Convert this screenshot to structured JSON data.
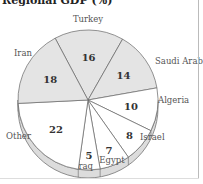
{
  "chart_data": {
    "type": "pie",
    "title": "Regional GDP (%)",
    "categories": [
      "Turkey",
      "Saudi Arabia",
      "Algeria",
      "Israel",
      "Egypt",
      "Iraq",
      "Other",
      "Iran"
    ],
    "values": [
      16,
      14,
      10,
      8,
      7,
      5,
      22,
      18
    ],
    "highlighted": [
      "Turkey",
      "Saudi Arabia",
      "Iran"
    ],
    "colors": {
      "highlight": "#e4e4e4",
      "normal": "#ffffff",
      "stroke": "#666666",
      "rim": "#dcdcdc"
    },
    "style": "3d-pie",
    "legend": "none (labels outside slices)"
  },
  "title": "Regional GDP (%)"
}
